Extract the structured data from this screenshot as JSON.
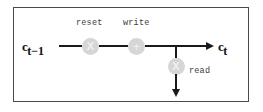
{
  "figure": {
    "type": "memory-cell-dataflow-diagram",
    "frame": {
      "border_color": "#4a4a4a",
      "background": "#ffffff"
    },
    "wire_color": "#1a1a1a",
    "node_fill": "#d6d6d6",
    "node_glyph_color": "#f0f0f0"
  },
  "inputs": {
    "previous_state": {
      "base": "c",
      "subscript": "t−1"
    }
  },
  "outputs": {
    "next_state": {
      "base": "c",
      "subscript": "t"
    }
  },
  "operations": [
    {
      "id": "reset",
      "label": "reset",
      "glyph": "X",
      "glyph_name": "multiply-glyph"
    },
    {
      "id": "write",
      "label": "write",
      "glyph": "+",
      "glyph_name": "plus-glyph"
    },
    {
      "id": "read",
      "label": "read",
      "glyph": "X",
      "glyph_name": "multiply-glyph"
    }
  ]
}
